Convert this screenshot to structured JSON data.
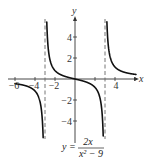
{
  "chart_data": {
    "type": "line",
    "title": "",
    "equation": "y = 2x / (x^2 - 9)",
    "equation_display": {
      "lhs": "y =",
      "numerator": "2x",
      "denominator": "x² − 9"
    },
    "xlabel": "x",
    "ylabel": "y",
    "xlim": [
      -6.5,
      6.5
    ],
    "ylim": [
      -5.5,
      5.5
    ],
    "x_ticks": [
      -6,
      -4,
      -2,
      2,
      4,
      6
    ],
    "x_tick_labels": [
      {
        "value": -6,
        "text": "−6"
      },
      {
        "value": -4,
        "text": "−4"
      },
      {
        "value": -2,
        "text": "−2"
      },
      {
        "value": 4,
        "text": "4"
      }
    ],
    "y_ticks": [
      -4,
      -2,
      2,
      4
    ],
    "y_tick_labels": [
      {
        "value": 4,
        "text": "4"
      },
      {
        "value": 2,
        "text": "2"
      },
      {
        "value": -2,
        "text": "−2"
      },
      {
        "value": -4,
        "text": "−4"
      }
    ],
    "vertical_asymptotes": [
      -3,
      3
    ],
    "horizontal_asymptote": 0,
    "grid": false,
    "legend": null,
    "series": [
      {
        "name": "left branch (x < -3)",
        "x": [
          -6,
          -5.5,
          -5,
          -4.5,
          -4,
          -3.6,
          -3.3,
          -3.15
        ],
        "values": [
          -0.44,
          -0.52,
          -0.63,
          -0.8,
          -1.14,
          -1.82,
          -3.49,
          -6.83
        ]
      },
      {
        "name": "middle branch (-3 < x < 3)",
        "x": [
          -2.85,
          -2.7,
          -2.5,
          -2,
          -1,
          0,
          1,
          2,
          2.5,
          2.7,
          2.85
        ],
        "values": [
          6.49,
          3.16,
          1.82,
          0.8,
          0.25,
          0,
          -0.25,
          -0.8,
          -1.82,
          -3.16,
          -6.49
        ]
      },
      {
        "name": "right branch (x > 3)",
        "x": [
          3.15,
          3.3,
          3.6,
          4,
          4.5,
          5,
          5.5,
          6
        ],
        "values": [
          6.83,
          3.49,
          1.82,
          1.14,
          0.8,
          0.63,
          0.52,
          0.44
        ]
      }
    ]
  },
  "style": {
    "curve_color": "#111111",
    "axis_color": "#333333",
    "asymptote_color": "#555555"
  }
}
